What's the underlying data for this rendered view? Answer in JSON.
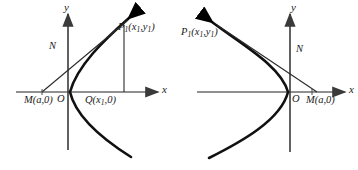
{
  "figure": {
    "type": "geometry-diagram",
    "ink_color": "#1a1a1a",
    "axis_color": "#6b6b6b",
    "curve_color": "#000000",
    "background": "#ffffff"
  },
  "panels": [
    {
      "id": "left",
      "orientation": "parabola-opens-right",
      "axes": {
        "x_label": "x",
        "y_label": "y",
        "origin_label": "O"
      },
      "points": [
        {
          "name": "P1",
          "label": "P",
          "sub1": "1",
          "args": "(x",
          "argsub": "1",
          "args2": ",y",
          "argsub2": "1",
          "args3": ")",
          "full": "P1(x1,y1)"
        },
        {
          "name": "M",
          "full": "M(a,0)"
        },
        {
          "name": "Q",
          "full": "Q(x1,0)"
        },
        {
          "name": "N",
          "full": "N"
        }
      ],
      "labels": {
        "p1_head": "P",
        "p1_sub": "1",
        "p1_open": "(x",
        "p1_sub2": "1",
        "p1_mid": ",y",
        "p1_sub3": "1",
        "p1_close": ")",
        "m_head": "M",
        "m_rest": "(a,0)",
        "q_head": "Q",
        "q_open": "(x",
        "q_sub": "1",
        "q_close": ",0)",
        "n": "N",
        "o": "O",
        "x": "x",
        "y": "y"
      }
    },
    {
      "id": "right",
      "orientation": "parabola-opens-left",
      "axes": {
        "x_label": "x",
        "y_label": "y",
        "origin_label": "O"
      },
      "points": [
        {
          "name": "P1",
          "full": "P1(x1,y1)"
        },
        {
          "name": "M",
          "full": "M(a,0)"
        },
        {
          "name": "N",
          "full": "N"
        }
      ],
      "labels": {
        "p1_head": "P",
        "p1_sub": "1",
        "p1_open": "(x",
        "p1_sub2": "1",
        "p1_mid": ",y",
        "p1_sub3": "1",
        "p1_close": ")",
        "m_head": "M",
        "m_rest": "(a,0)",
        "n": "N",
        "o": "O",
        "x": "x",
        "y": "y"
      }
    }
  ]
}
